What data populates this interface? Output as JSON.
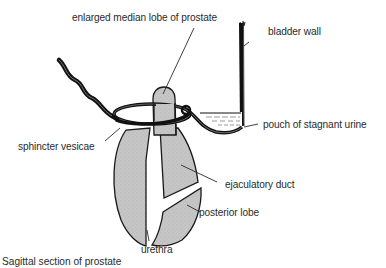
{
  "diagram": {
    "colors": {
      "tissue_fill": "#c8c8c8",
      "outline": "#1a1a1a",
      "label_text": "#2a2a2a",
      "background": "#ffffff"
    },
    "labels": {
      "median_lobe": "enlarged median lobe of prostate",
      "bladder_wall": "bladder wall",
      "pouch": "pouch of stagnant urine",
      "sphincter": "sphincter vesicae",
      "ejaculatory_duct": "ejaculatory duct",
      "posterior_lobe": "posterior lobe",
      "urethra": "urethra"
    },
    "caption": "Sagittal section of prostate"
  }
}
